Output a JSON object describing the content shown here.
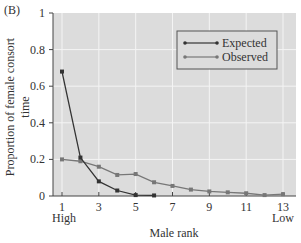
{
  "panel_label": "(B)",
  "chart_data": {
    "type": "line",
    "title": "",
    "xlabel": "Male rank",
    "ylabel": "Proportion of female consort time",
    "x_extremes": {
      "left": "High",
      "right": "Low"
    },
    "x": [
      1,
      2,
      3,
      4,
      5,
      6,
      7,
      8,
      9,
      10,
      11,
      12,
      13
    ],
    "xticks": [
      1,
      3,
      5,
      7,
      9,
      11,
      13
    ],
    "yticks": [
      0,
      0.2,
      0.4,
      0.6,
      0.8,
      1
    ],
    "ylim": [
      0,
      1
    ],
    "grid": true,
    "legend_position": "upper right",
    "series": [
      {
        "name": "Expected",
        "color": "#333333",
        "values": [
          0.68,
          0.21,
          0.08,
          0.03,
          0.005,
          0.003,
          null,
          null,
          null,
          null,
          null,
          null,
          null
        ]
      },
      {
        "name": "Observed",
        "color": "#777777",
        "values": [
          0.2,
          0.19,
          0.16,
          0.115,
          0.12,
          0.075,
          0.055,
          0.035,
          0.025,
          0.02,
          0.015,
          0.005,
          0.01
        ]
      }
    ]
  }
}
